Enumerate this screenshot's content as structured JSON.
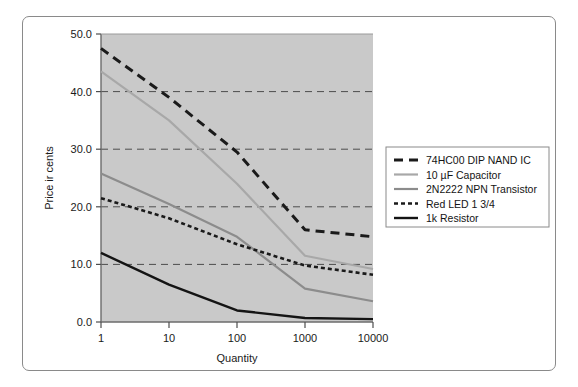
{
  "chart_data": {
    "type": "line",
    "title": "",
    "xlabel": "Quantity",
    "ylabel": "Price in cents",
    "ylabel_rendered": "Price ir cents",
    "categories": [
      "1",
      "10",
      "100",
      "1000",
      "10000"
    ],
    "x": [
      1,
      10,
      100,
      1000,
      10000
    ],
    "xscale": "category-log",
    "ylim": [
      0.0,
      50.0
    ],
    "ytick_labels": [
      "0.0",
      "10.0",
      "20.0",
      "30.0",
      "40.0",
      "50.0"
    ],
    "ytick_values": [
      0.0,
      10.0,
      20.0,
      30.0,
      40.0,
      50.0
    ],
    "grid": true,
    "grid_axis": "y",
    "legend_position": "right",
    "plot_background": "#c9c9c9",
    "series": [
      {
        "name": "74HC00 DIP NAND IC",
        "values": [
          47.5,
          39.0,
          29.5,
          16.0,
          14.8
        ],
        "color": "#1a1a1a",
        "style": "dashed",
        "width": 3.0,
        "dasharray": "9 6"
      },
      {
        "name": "10 µF Capacitor",
        "values": [
          43.5,
          35.0,
          24.0,
          11.5,
          9.2
        ],
        "color": "#a8a8a8",
        "style": "solid",
        "width": 2.2,
        "dasharray": ""
      },
      {
        "name": "2N2222 NPN Transistor",
        "values": [
          25.8,
          20.5,
          14.8,
          5.8,
          3.6
        ],
        "color": "#8c8c8c",
        "style": "solid",
        "width": 2.2,
        "dasharray": ""
      },
      {
        "name": "Red LED 1 3/4",
        "values": [
          21.5,
          18.0,
          13.5,
          9.8,
          8.2
        ],
        "color": "#1a1a1a",
        "style": "dotted",
        "width": 2.6,
        "dasharray": "4 3"
      },
      {
        "name": "1k Resistor",
        "values": [
          12.0,
          6.5,
          2.0,
          0.7,
          0.5
        ],
        "color": "#141414",
        "style": "solid",
        "width": 2.4,
        "dasharray": ""
      }
    ]
  },
  "legend": {
    "entries": [
      {
        "label": "74HC00 DIP NAND IC"
      },
      {
        "label": "10 µF Capacitor"
      },
      {
        "label": "2N2222 NPN Transistor"
      },
      {
        "label": "Red LED 1 3/4"
      },
      {
        "label": "1k Resistor"
      }
    ]
  }
}
